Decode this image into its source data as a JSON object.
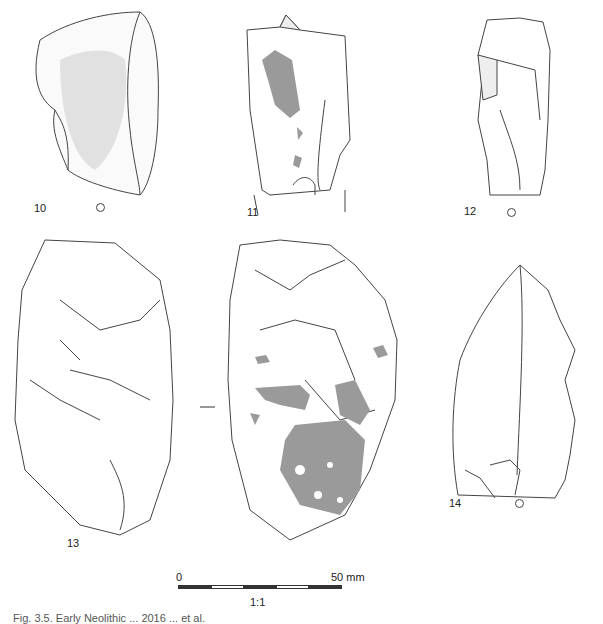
{
  "figure": {
    "artifacts": [
      {
        "id": "10",
        "label": "10",
        "view": "dorsal, cortex stippled",
        "orientation_mark": "circle"
      },
      {
        "id": "11",
        "label": "11",
        "view": "dorsal, grey patination",
        "orientation_mark": "none"
      },
      {
        "id": "12",
        "label": "12",
        "view": "dorsal",
        "orientation_mark": "circle"
      },
      {
        "id": "13",
        "label": "13",
        "view": "two faces, grey patination on second face",
        "orientation_mark": "dash"
      },
      {
        "id": "14",
        "label": "14",
        "view": "dorsal",
        "orientation_mark": "circle"
      }
    ],
    "scale_bar": {
      "start_label": "0",
      "end_label": "50 mm",
      "ratio": "1:1"
    },
    "caption": "Fig. 3.5. Early Neolithic ... 2016 ... et al."
  },
  "colors": {
    "line": "#333333",
    "patina": "#9a9a9a",
    "background": "#ffffff"
  }
}
